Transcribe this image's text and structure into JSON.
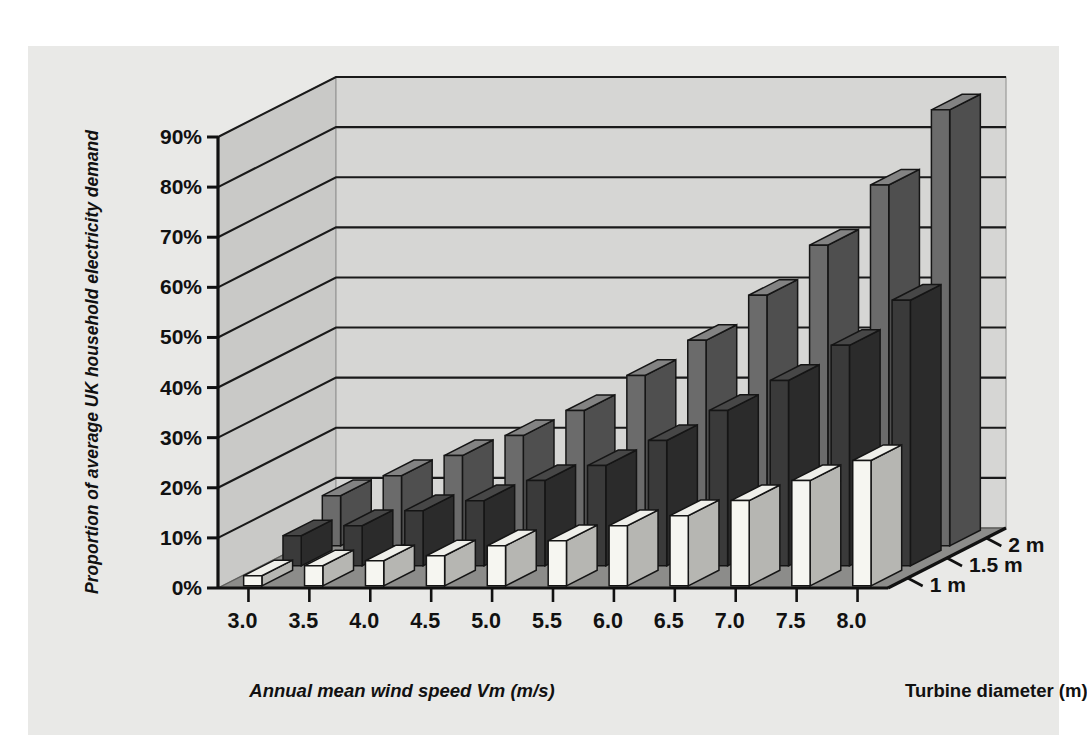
{
  "figure": {
    "panel_bg": "#e9e9e7",
    "page_bg": "#ffffff",
    "wall_color": "#d6d6d4",
    "wall_side_color": "#c9c9c7",
    "floor_color": "#8c8c8a",
    "gridline_color": "#1a1a1a",
    "axis_color": "#111111"
  },
  "axes": {
    "y_label": "Proportion of average UK household electricity demand",
    "x_label": "Annual mean wind speed Vm (m/s)",
    "z_label": "Turbine diameter (m)",
    "y_ticks": [
      "0%",
      "10%",
      "20%",
      "30%",
      "40%",
      "50%",
      "60%",
      "70%",
      "80%",
      "90%"
    ],
    "y_tick_values": [
      0,
      10,
      20,
      30,
      40,
      50,
      60,
      70,
      80,
      90
    ],
    "x_ticks": [
      "3.0",
      "3.5",
      "4.0",
      "4.5",
      "5.0",
      "5.5",
      "6.0",
      "6.5",
      "7.0",
      "7.5",
      "8.0"
    ],
    "z_ticks": [
      "1 m",
      "1.5 m",
      "2 m"
    ]
  },
  "chart_data": {
    "type": "bar",
    "subtype": "3d-grouped-bar",
    "title": "",
    "xlabel": "Annual mean wind speed Vm (m/s)",
    "ylabel": "Proportion of average UK household electricity demand",
    "zlabel": "Turbine diameter (m)",
    "ylim": [
      0,
      90
    ],
    "yunit": "%",
    "grid": true,
    "legend_position": "depth-axis-right",
    "categories": [
      "3.0",
      "3.5",
      "4.0",
      "4.5",
      "5.0",
      "5.5",
      "6.0",
      "6.5",
      "7.0",
      "7.5",
      "8.0"
    ],
    "series": [
      {
        "name": "2 m",
        "color": "#6b6b6b",
        "depth_index": 2,
        "values": [
          10,
          14,
          18,
          22,
          27,
          34,
          41,
          50,
          60,
          72,
          87
        ]
      },
      {
        "name": "1.5 m",
        "color": "#3a3a3a",
        "depth_index": 1,
        "values": [
          6,
          8,
          11,
          13,
          17,
          20,
          25,
          31,
          37,
          44,
          53
        ]
      },
      {
        "name": "1 m",
        "color": "#f6f6f1",
        "depth_index": 0,
        "values": [
          2,
          4,
          5,
          6,
          8,
          9,
          12,
          14,
          17,
          21,
          25
        ]
      }
    ]
  }
}
